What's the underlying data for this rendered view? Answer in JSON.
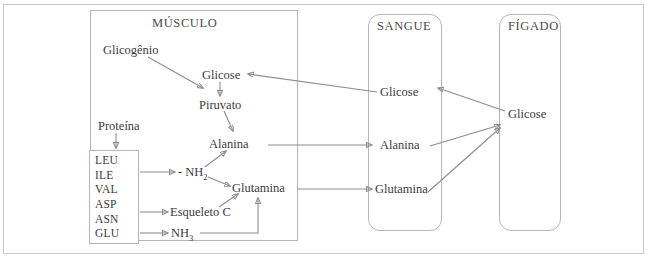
{
  "figure": {
    "type": "biochemistry-pathway-diagram",
    "language": "pt-BR",
    "title_visible": false,
    "background": "#ffffff",
    "line_color": "#8d8d8d",
    "text_color": "#3b3b3b",
    "border_color": "#b5b5b5"
  },
  "compartments": {
    "muscle": {
      "header": "MÚSCULO",
      "shape": "rectangle",
      "nodes": {
        "glycogen": "Glicogênio",
        "glucose": "Glicose",
        "pyruvate": "Piruvato",
        "alanine": "Alanina",
        "protein": "Proteína",
        "amino_group": "- NH",
        "amino_group_sub": "2",
        "carbon_skeleton": "Esqueleto C",
        "ammonia": "NH",
        "ammonia_sub": "3",
        "glutamine": "Glutamina"
      },
      "amino_acids": [
        "LEU",
        "ILE",
        "VAL",
        "ASP",
        "ASN",
        "GLU"
      ]
    },
    "blood": {
      "header": "SANGUE",
      "shape": "rounded-rectangle",
      "nodes": {
        "glucose": "Glicose",
        "alanine": "Alanina",
        "glutamine": "Glutamina"
      }
    },
    "liver": {
      "header": "FÍGADO",
      "shape": "rounded-rectangle",
      "nodes": {
        "glucose": "Glicose"
      }
    }
  },
  "arrows": [
    {
      "from": "muscle.glycogen",
      "to": "muscle.pyruvate",
      "style": "diagonal"
    },
    {
      "from": "muscle.glucose",
      "to": "muscle.pyruvate",
      "style": "vertical"
    },
    {
      "from": "muscle.pyruvate",
      "to": "muscle.alanine",
      "style": "diagonal"
    },
    {
      "from": "muscle.protein",
      "to": "muscle.amino_acids",
      "style": "vertical"
    },
    {
      "from": "muscle.amino_acids",
      "to": "muscle.amino_group",
      "style": "horizontal"
    },
    {
      "from": "muscle.amino_acids",
      "to": "muscle.carbon_skeleton",
      "style": "horizontal"
    },
    {
      "from": "muscle.amino_acids",
      "to": "muscle.ammonia",
      "style": "horizontal"
    },
    {
      "from": "muscle.amino_group",
      "to": "muscle.alanine",
      "style": "diagonal"
    },
    {
      "from": "muscle.amino_group",
      "to": "muscle.glutamine",
      "style": "diagonal"
    },
    {
      "from": "muscle.carbon_skeleton",
      "to": "muscle.glutamine",
      "style": "diagonal"
    },
    {
      "from": "muscle.ammonia",
      "to": "muscle.glutamine",
      "style": "elbow"
    },
    {
      "from": "muscle.alanine",
      "to": "blood.alanine",
      "style": "horizontal"
    },
    {
      "from": "muscle.glutamine",
      "to": "blood.glutamine",
      "style": "horizontal"
    },
    {
      "from": "blood.glucose",
      "to": "muscle.glucose",
      "style": "horizontal-left"
    },
    {
      "from": "blood.alanine",
      "to": "liver.glucose",
      "style": "diagonal"
    },
    {
      "from": "blood.glutamine",
      "to": "liver.glucose",
      "style": "diagonal"
    },
    {
      "from": "liver.glucose",
      "to": "blood.glucose",
      "style": "diagonal-left"
    }
  ]
}
